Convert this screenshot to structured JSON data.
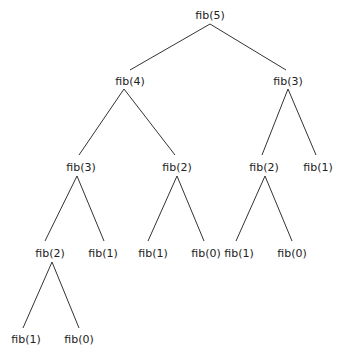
{
  "nodes": [
    {
      "id": "n0",
      "label": "fib(5)",
      "x": 210,
      "y": 15
    },
    {
      "id": "n1",
      "label": "fib(4)",
      "x": 130,
      "y": 81
    },
    {
      "id": "n2",
      "label": "fib(3)",
      "x": 288,
      "y": 81
    },
    {
      "id": "n3",
      "label": "fib(3)",
      "x": 81,
      "y": 167
    },
    {
      "id": "n4",
      "label": "fib(2)",
      "x": 177,
      "y": 167
    },
    {
      "id": "n5",
      "label": "fib(2)",
      "x": 264,
      "y": 167
    },
    {
      "id": "n6",
      "label": "fib(1)",
      "x": 318,
      "y": 167
    },
    {
      "id": "n7",
      "label": "fib(2)",
      "x": 50,
      "y": 253
    },
    {
      "id": "n8",
      "label": "fib(1)",
      "x": 103,
      "y": 253
    },
    {
      "id": "n9",
      "label": "fib(1)",
      "x": 153,
      "y": 253
    },
    {
      "id": "n10",
      "label": "fib(0)",
      "x": 206,
      "y": 253
    },
    {
      "id": "n11",
      "label": "fib(1)",
      "x": 239,
      "y": 253
    },
    {
      "id": "n12",
      "label": "fib(0)",
      "x": 292,
      "y": 253
    },
    {
      "id": "n13",
      "label": "fib(1)",
      "x": 26,
      "y": 339
    },
    {
      "id": "n14",
      "label": "fib(0)",
      "x": 79,
      "y": 339
    }
  ],
  "edges": [
    {
      "from": "n0",
      "to": "n1",
      "x1": 210,
      "y1": 24,
      "x2": 130,
      "y2": 70
    },
    {
      "from": "n0",
      "to": "n2",
      "x1": 210,
      "y1": 24,
      "x2": 286,
      "y2": 70
    },
    {
      "from": "n1",
      "to": "n3",
      "x1": 124,
      "y1": 89,
      "x2": 79,
      "y2": 155
    },
    {
      "from": "n1",
      "to": "n4",
      "x1": 124,
      "y1": 89,
      "x2": 175,
      "y2": 155
    },
    {
      "from": "n2",
      "to": "n5",
      "x1": 288,
      "y1": 89,
      "x2": 262,
      "y2": 155
    },
    {
      "from": "n2",
      "to": "n6",
      "x1": 288,
      "y1": 89,
      "x2": 316,
      "y2": 155
    },
    {
      "from": "n3",
      "to": "n7",
      "x1": 77,
      "y1": 176,
      "x2": 45,
      "y2": 241
    },
    {
      "from": "n3",
      "to": "n8",
      "x1": 77,
      "y1": 176,
      "x2": 104,
      "y2": 241
    },
    {
      "from": "n4",
      "to": "n9",
      "x1": 177,
      "y1": 176,
      "x2": 148,
      "y2": 241
    },
    {
      "from": "n4",
      "to": "n10",
      "x1": 177,
      "y1": 176,
      "x2": 204,
      "y2": 241
    },
    {
      "from": "n5",
      "to": "n11",
      "x1": 265,
      "y1": 176,
      "x2": 236,
      "y2": 241
    },
    {
      "from": "n5",
      "to": "n12",
      "x1": 265,
      "y1": 176,
      "x2": 292,
      "y2": 241
    },
    {
      "from": "n7",
      "to": "n13",
      "x1": 52,
      "y1": 262,
      "x2": 23,
      "y2": 328
    },
    {
      "from": "n7",
      "to": "n14",
      "x1": 52,
      "y1": 262,
      "x2": 79,
      "y2": 328
    }
  ],
  "colors": {
    "line": "#333333",
    "text": "#222222",
    "background": "#ffffff"
  }
}
